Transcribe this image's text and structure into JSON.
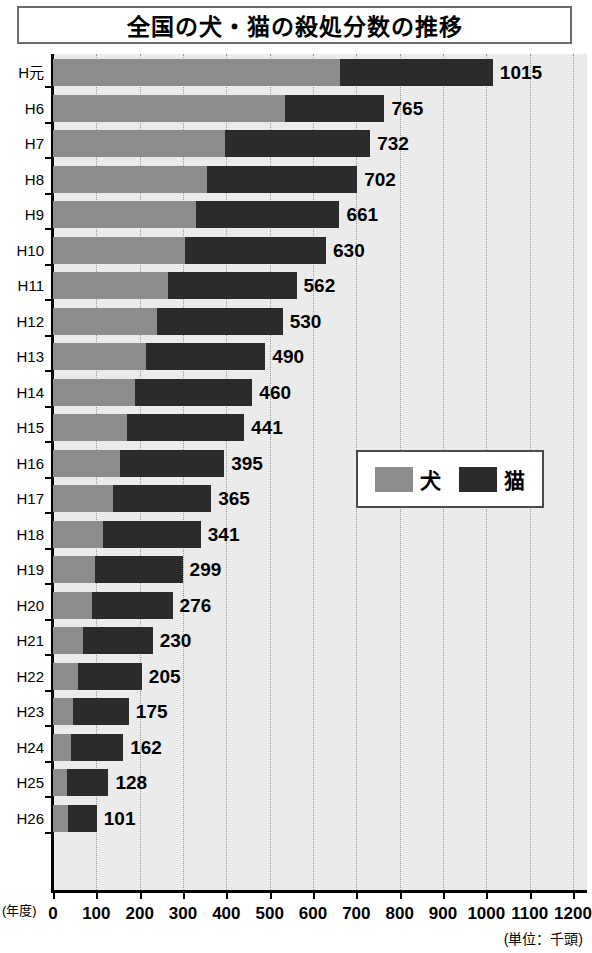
{
  "title": "全国の犬・猫の殺処分数の推移",
  "axis": {
    "y_unit": "(年度)",
    "x_unit": "(単位：千頭)",
    "x_ticks": [
      0,
      100,
      200,
      300,
      400,
      500,
      600,
      700,
      800,
      900,
      1000,
      1100,
      1200
    ]
  },
  "legend": {
    "entries": [
      {
        "label": "犬",
        "color": "#8c8c8c",
        "name": "dog"
      },
      {
        "label": "猫",
        "color": "#2b2b2b",
        "name": "cat"
      }
    ]
  },
  "chart_data": {
    "type": "bar",
    "orientation": "horizontal",
    "stacked": true,
    "title": "全国の犬・猫の殺処分数の推移",
    "xlabel": "(単位：千頭)",
    "ylabel": "(年度)",
    "xlim": [
      0,
      1200
    ],
    "grid": true,
    "legend_position": "middle-right",
    "categories": [
      "H元",
      "H6",
      "H7",
      "H8",
      "H9",
      "H10",
      "H11",
      "H12",
      "H13",
      "H14",
      "H15",
      "H16",
      "H17",
      "H18",
      "H19",
      "H20",
      "H21",
      "H22",
      "H23",
      "H24",
      "H25",
      "H26"
    ],
    "series": [
      {
        "name": "犬",
        "color": "#8c8c8c",
        "values": [
          662,
          535,
          397,
          355,
          330,
          305,
          265,
          240,
          215,
          190,
          170,
          155,
          139,
          115,
          98,
          90,
          69,
          58,
          46,
          41,
          33,
          35
        ]
      },
      {
        "name": "猫",
        "color": "#2b2b2b",
        "values": [
          353,
          230,
          335,
          347,
          331,
          325,
          297,
          290,
          275,
          270,
          271,
          240,
          226,
          226,
          201,
          186,
          161,
          147,
          129,
          121,
          95,
          66
        ]
      }
    ],
    "totals": [
      1015,
      765,
      732,
      702,
      661,
      630,
      562,
      530,
      490,
      460,
      441,
      395,
      365,
      341,
      299,
      276,
      230,
      205,
      175,
      162,
      128,
      101
    ],
    "data_labels": [
      "1015",
      "765",
      "732",
      "702",
      "661",
      "630",
      "562",
      "530",
      "490",
      "460",
      "441",
      "395",
      "365",
      "341",
      "299",
      "276",
      "230",
      "205",
      "175",
      "162",
      "128",
      "101"
    ]
  }
}
